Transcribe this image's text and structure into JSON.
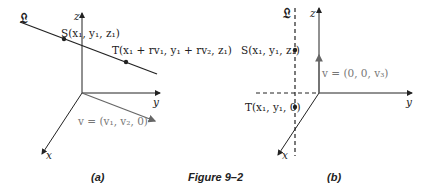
{
  "figure": {
    "caption": "Figure 9–2",
    "panel_a": {
      "label": "(a)",
      "line_label": "𝔏",
      "point_S": "S(x₁, y₁, z₁)",
      "point_T": "T(x₁ + rv₁, y₁ + rv₂, z₁)",
      "vector": "v = (v₁, v₂, 0)",
      "axis_x": "x",
      "axis_y": "y",
      "axis_z": "z"
    },
    "panel_b": {
      "label": "(b)",
      "line_label": "𝔏",
      "point_S": "S(x₁, y₁, z₁)",
      "point_T": "T(x₁, y₁, 0)",
      "vector": "v = (0, 0, v₃)",
      "axis_x": "x",
      "axis_y": "y",
      "axis_z": "z"
    }
  }
}
